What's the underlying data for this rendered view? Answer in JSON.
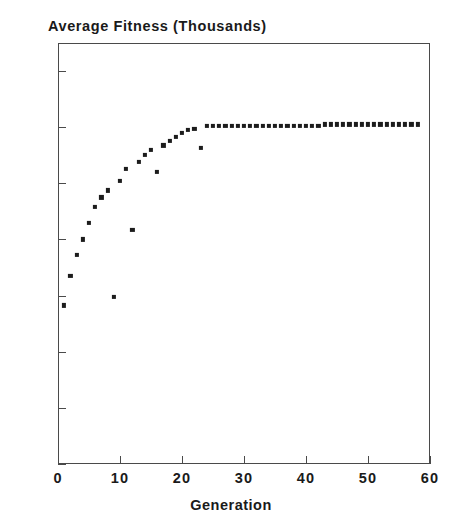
{
  "chart_data": {
    "type": "scatter",
    "title": "Average Fitness (Thousands)",
    "xlabel": "Generation",
    "ylabel": "",
    "xlim": [
      0,
      60
    ],
    "ylim": [
      200,
      215
    ],
    "xticks": [
      0,
      10,
      20,
      30,
      40,
      50,
      60
    ],
    "yticks": [
      200,
      202,
      204,
      206,
      208,
      210,
      212,
      214
    ],
    "grid": false,
    "legend": null,
    "marker": "square",
    "marker_color": "#1c1c1c",
    "series": [
      {
        "name": "Average Fitness",
        "x": [
          1,
          2,
          3,
          4,
          5,
          6,
          7,
          8,
          9,
          10,
          11,
          12,
          13,
          14,
          15,
          16,
          17,
          18,
          19,
          20,
          21,
          22,
          23,
          24,
          25,
          26,
          27,
          28,
          29,
          30,
          31,
          32,
          33,
          34,
          35,
          36,
          37,
          38,
          39,
          40,
          41,
          42,
          43,
          44,
          45,
          46,
          47,
          48,
          49,
          50,
          51,
          52,
          53,
          54,
          55,
          56,
          57,
          58
        ],
        "y": [
          205.65,
          206.7,
          207.45,
          208.0,
          208.6,
          209.15,
          209.5,
          209.75,
          205.95,
          210.1,
          210.5,
          208.35,
          210.75,
          211.0,
          211.2,
          210.4,
          211.35,
          211.5,
          211.65,
          211.8,
          211.9,
          211.95,
          211.25,
          212.05,
          212.05,
          212.05,
          212.05,
          212.05,
          212.05,
          212.05,
          212.05,
          212.05,
          212.05,
          212.05,
          212.05,
          212.05,
          212.05,
          212.05,
          212.05,
          212.05,
          212.05,
          212.05,
          212.1,
          212.1,
          212.1,
          212.1,
          212.1,
          212.1,
          212.1,
          212.1,
          212.1,
          212.1,
          212.1,
          212.1,
          212.1,
          212.1,
          212.1,
          212.1
        ]
      }
    ]
  }
}
